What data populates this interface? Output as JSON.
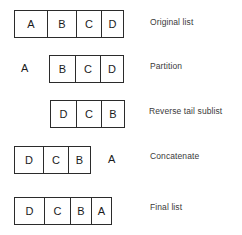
{
  "diagram": {
    "stroke_color": "#2b2b2b",
    "text_color": "#1b1b1b",
    "label_color": "#3a3a3a",
    "background": "#ffffff",
    "rows": [
      {
        "id": "original-list",
        "label": "Original list",
        "cells": [
          "A",
          "B",
          "C",
          "D"
        ],
        "loose_letter": null,
        "loose_position": null
      },
      {
        "id": "partition",
        "label": "Partition",
        "cells": [
          "B",
          "C",
          "D"
        ],
        "loose_letter": "A",
        "loose_position": "left"
      },
      {
        "id": "reverse-tail-sublist",
        "label": "Reverse tail sublist",
        "cells": [
          "D",
          "C",
          "B"
        ],
        "loose_letter": null,
        "loose_position": null
      },
      {
        "id": "concatenate",
        "label": "Concatenate",
        "cells": [
          "D",
          "C",
          "B"
        ],
        "loose_letter": "A",
        "loose_position": "right"
      },
      {
        "id": "final-list",
        "label": "Final list",
        "cells": [
          "D",
          "C",
          "B",
          "A"
        ],
        "loose_letter": null,
        "loose_position": null
      }
    ]
  }
}
